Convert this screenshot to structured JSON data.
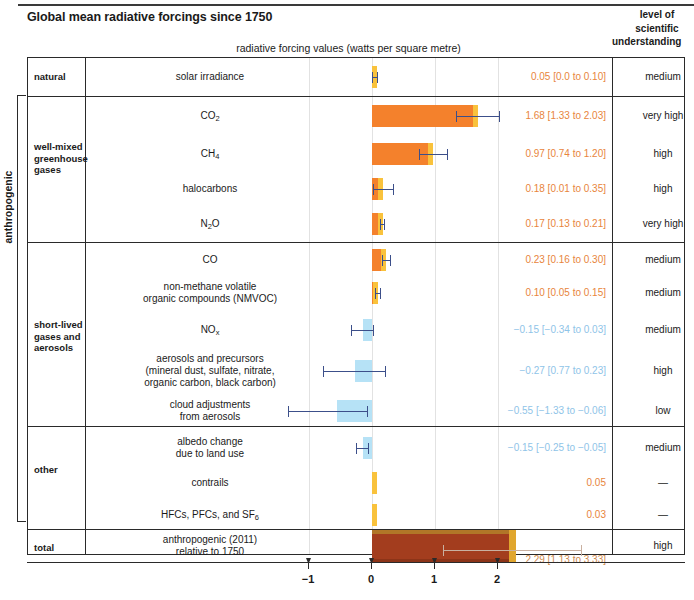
{
  "title": "Global mean radiative forcings since 1750",
  "axis_units_label": "radiative forcing values (watts per square metre)",
  "losu_header": {
    "line1": "level of",
    "line2": "scientific",
    "line3": "understanding"
  },
  "anthropogenic_label": "anthropogenic",
  "groups": [
    {
      "label": "natural"
    },
    {
      "label": "well-mixed\ngreenhouse\ngases",
      "l1": "well-mixed",
      "l2": "greenhouse",
      "l3": "gases"
    },
    {
      "label": "short-lived\ngases and\naerosols",
      "l1": "short-lived",
      "l2": "gases and",
      "l3": "aerosols"
    },
    {
      "label": "other"
    },
    {
      "label": "total"
    }
  ],
  "rows": [
    {
      "name": "solar irradiance",
      "value_text": "0.05 [0.0 to 0.10]",
      "losu": "medium"
    },
    {
      "name": "CO2",
      "value_text": "1.68 [1.33 to 2.03]",
      "losu": "very high"
    },
    {
      "name": "CH4",
      "value_text": "0.97 [0.74 to 1.20]",
      "losu": "high"
    },
    {
      "name": "halocarbons",
      "value_text": "0.18 [0.01 to 0.35]",
      "losu": "high"
    },
    {
      "name": "N2O",
      "value_text": "0.17 [0.13 to 0.21]",
      "losu": "very high"
    },
    {
      "name": "CO",
      "value_text": "0.23 [0.16 to 0.30]",
      "losu": "medium"
    },
    {
      "name": "non-methane volatile organic compounds (NMVOC)",
      "l1": "non-methane volatile",
      "l2": "organic compounds (NMVOC)",
      "value_text": "0.10 [0.05 to 0.15]",
      "losu": "medium"
    },
    {
      "name": "NOx",
      "value_text": "−0.15 [−0.34 to 0.03]",
      "losu": "medium"
    },
    {
      "name": "aerosols and precursors (mineral dust, sulfate, nitrate, organic carbon, black carbon)",
      "l1": "aerosols and precursors",
      "l2": "(mineral dust, sulfate, nitrate,",
      "l3": "organic carbon, black carbon)",
      "value_text": "−0.27 [0.77 to 0.23]",
      "losu": "high"
    },
    {
      "name": "cloud adjustments from aerosols",
      "l1": "cloud adjustments",
      "l2": "from aerosols",
      "value_text": "−0.55 [−1.33 to −0.06]",
      "losu": "low"
    },
    {
      "name": "albedo change due to land use",
      "l1": "albedo change",
      "l2": "due to land use",
      "value_text": "−0.15 [−0.25 to −0.05]",
      "losu": "medium"
    },
    {
      "name": "contrails",
      "value_text": "0.05",
      "losu": "—"
    },
    {
      "name": "HFCs, PFCs, and SF6",
      "value_text": "0.03",
      "losu": "—"
    },
    {
      "name": "anthropogenic (2011) relative to 1750",
      "l1": "anthropogenic (2011)",
      "l2": "relative to 1750",
      "value_text": "2.29 [1.13 to 3.33]",
      "losu": "high"
    }
  ],
  "axis": {
    "ticks": [
      -1,
      0,
      1,
      2
    ],
    "tick_labels": [
      "−1",
      "0",
      "1",
      "2"
    ],
    "gridlines": [
      -1,
      0,
      1,
      2
    ],
    "min": -1.6,
    "max": 2.7
  },
  "colors": {
    "positive_bar": "#f4812c",
    "positive_bar_cap": "#f9c23c",
    "negative_bar": "#a9ddf4",
    "total_bar": "#a33d1e",
    "total_bar_cap": "#e0a62e",
    "error_bar": "#3c4f8a",
    "positive_value_text": "#e8853c",
    "negative_value_text": "#8fc4e8",
    "total_value_text": "#cf8a4e",
    "frame": "#2a2a2a",
    "gridline": "#e2e2e2"
  },
  "chart_data": {
    "type": "bar",
    "orientation": "horizontal",
    "title": "Global mean radiative forcings since 1750",
    "xlabel": "radiative forcing values (watts per square metre)",
    "ylabel": "",
    "xlim": [
      -1.6,
      2.7
    ],
    "xticks": [
      -1,
      0,
      1,
      2
    ],
    "grid": true,
    "legend": "none",
    "categories": [
      "solar irradiance",
      "CO2",
      "CH4",
      "halocarbons",
      "N2O",
      "CO",
      "non-methane volatile organic compounds (NMVOC)",
      "NOx",
      "aerosols and precursors (mineral dust, sulfate, nitrate, organic carbon, black carbon)",
      "cloud adjustments from aerosols",
      "albedo change due to land use",
      "contrails",
      "HFCs, PFCs, and SF6",
      "anthropogenic (2011) relative to 1750"
    ],
    "values": [
      0.05,
      1.68,
      0.97,
      0.18,
      0.17,
      0.23,
      0.1,
      -0.15,
      -0.27,
      -0.55,
      -0.15,
      0.05,
      0.03,
      2.29
    ],
    "errors_low": [
      0.0,
      1.33,
      0.74,
      0.01,
      0.13,
      0.16,
      0.05,
      -0.34,
      -0.77,
      -1.33,
      -0.25,
      null,
      null,
      1.13
    ],
    "errors_high": [
      0.1,
      2.03,
      1.2,
      0.35,
      0.21,
      0.3,
      0.15,
      0.03,
      0.23,
      -0.06,
      -0.05,
      null,
      null,
      3.33
    ],
    "groups": [
      "natural",
      "well-mixed greenhouse gases",
      "well-mixed greenhouse gases",
      "well-mixed greenhouse gases",
      "well-mixed greenhouse gases",
      "short-lived gases and aerosols",
      "short-lived gases and aerosols",
      "short-lived gases and aerosols",
      "short-lived gases and aerosols",
      "short-lived gases and aerosols",
      "other",
      "other",
      "other",
      "total"
    ],
    "level_of_scientific_understanding": [
      "medium",
      "very high",
      "high",
      "high",
      "very high",
      "medium",
      "medium",
      "medium",
      "high",
      "low",
      "medium",
      "—",
      "—",
      "high"
    ]
  }
}
